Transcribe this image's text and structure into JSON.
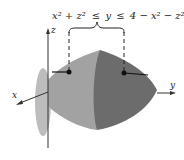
{
  "figure": {
    "inequality": {
      "left": "x² + z²",
      "op1": "≤",
      "mid": "y",
      "op2": "≤",
      "right": "4 − x² − z²"
    },
    "axes": {
      "x": "x",
      "y": "y",
      "z": "z"
    },
    "colors": {
      "disk": "#b4b4b4",
      "left_surface": "#9a9a9a",
      "right_surface": "#6a6a6a",
      "axis": "#333333"
    }
  }
}
